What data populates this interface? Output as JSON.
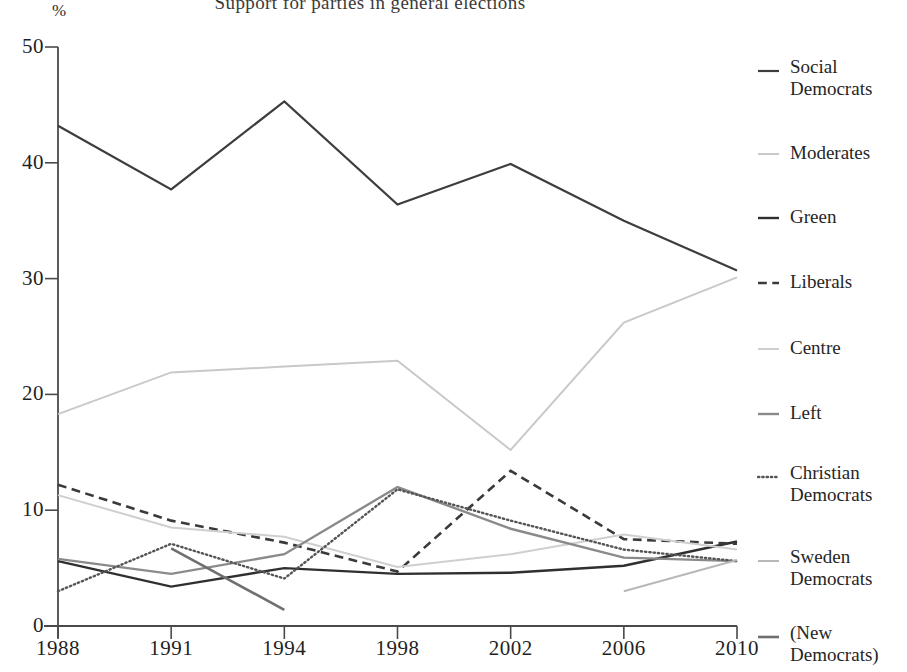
{
  "figure": {
    "title_clipped": "Support for parties in general elections",
    "y_axis_unit": "%",
    "y_ticks": [
      "50",
      "40",
      "30",
      "20",
      "10",
      "0"
    ],
    "x_ticks": [
      "1988",
      "1991",
      "1994",
      "1998",
      "2002",
      "2006",
      "2010"
    ]
  },
  "legend": {
    "items": [
      {
        "label": "Social\nDemocrats",
        "style": "solid",
        "color": "#3d3d3d",
        "width": 2.2
      },
      {
        "label": "Moderates",
        "style": "solid",
        "color": "#c9c9c9",
        "width": 2.0
      },
      {
        "label": "Green",
        "style": "solid",
        "color": "#2f2f2f",
        "width": 2.4
      },
      {
        "label": "Liberals",
        "style": "dashed",
        "color": "#3a3a3a",
        "width": 2.6
      },
      {
        "label": "Centre",
        "style": "solid",
        "color": "#cfcfcf",
        "width": 2.0
      },
      {
        "label": "Left",
        "style": "solid",
        "color": "#8a8a8a",
        "width": 2.4
      },
      {
        "label": "Christian\nDemocrats",
        "style": "dotted",
        "color": "#555555",
        "width": 2.4
      },
      {
        "label": "Sweden\nDemocrats",
        "style": "solid",
        "color": "#b8b8b8",
        "width": 2.0
      },
      {
        "label": "(New\nDemocrats)",
        "style": "solid",
        "color": "#6f6f6f",
        "width": 2.6
      }
    ]
  },
  "chart_data": {
    "type": "line",
    "title": "Support for parties in general elections",
    "xlabel": "",
    "ylabel": "%",
    "ylim": [
      0,
      50
    ],
    "ytick_values": [
      0,
      10,
      20,
      30,
      40,
      50
    ],
    "grid": false,
    "legend_position": "right",
    "categories": [
      "1988",
      "1991",
      "1994",
      "1998",
      "2002",
      "2006",
      "2010"
    ],
    "series": [
      {
        "name": "Social Democrats",
        "style": "solid",
        "color": "#3d3d3d",
        "width": 2.2,
        "values": [
          43.2,
          37.7,
          45.3,
          36.4,
          39.9,
          35.0,
          30.7
        ]
      },
      {
        "name": "Moderates",
        "style": "solid",
        "color": "#c9c9c9",
        "width": 2.0,
        "values": [
          18.3,
          21.9,
          22.4,
          22.9,
          15.2,
          26.2,
          30.1
        ]
      },
      {
        "name": "Green",
        "style": "solid",
        "color": "#2f2f2f",
        "width": 2.4,
        "values": [
          5.6,
          3.4,
          5.0,
          4.5,
          4.6,
          5.2,
          7.3
        ]
      },
      {
        "name": "Liberals",
        "style": "dashed",
        "color": "#3a3a3a",
        "width": 2.6,
        "values": [
          12.2,
          9.1,
          7.2,
          4.7,
          13.4,
          7.5,
          7.1
        ]
      },
      {
        "name": "Centre",
        "style": "solid",
        "color": "#cfcfcf",
        "width": 2.0,
        "values": [
          11.3,
          8.5,
          7.7,
          5.1,
          6.2,
          7.9,
          6.6
        ]
      },
      {
        "name": "Left",
        "style": "solid",
        "color": "#8a8a8a",
        "width": 2.4,
        "values": [
          5.8,
          4.5,
          6.2,
          12.0,
          8.4,
          5.9,
          5.6
        ]
      },
      {
        "name": "Christian Democrats",
        "style": "dotted",
        "color": "#555555",
        "width": 2.4,
        "values": [
          3.0,
          7.1,
          4.1,
          11.8,
          9.1,
          6.6,
          5.6
        ]
      },
      {
        "name": "Sweden Democrats",
        "style": "solid",
        "color": "#b8b8b8",
        "width": 2.0,
        "values": [
          null,
          null,
          null,
          null,
          null,
          3.0,
          5.7
        ]
      },
      {
        "name": "(New Democrats)",
        "style": "solid",
        "color": "#6f6f6f",
        "width": 2.6,
        "values": [
          null,
          6.7,
          1.4,
          null,
          null,
          null,
          null
        ]
      }
    ]
  },
  "axes_geometry": {
    "plot_left": 58,
    "plot_right": 737,
    "plot_top": 47,
    "plot_bottom": 626
  }
}
